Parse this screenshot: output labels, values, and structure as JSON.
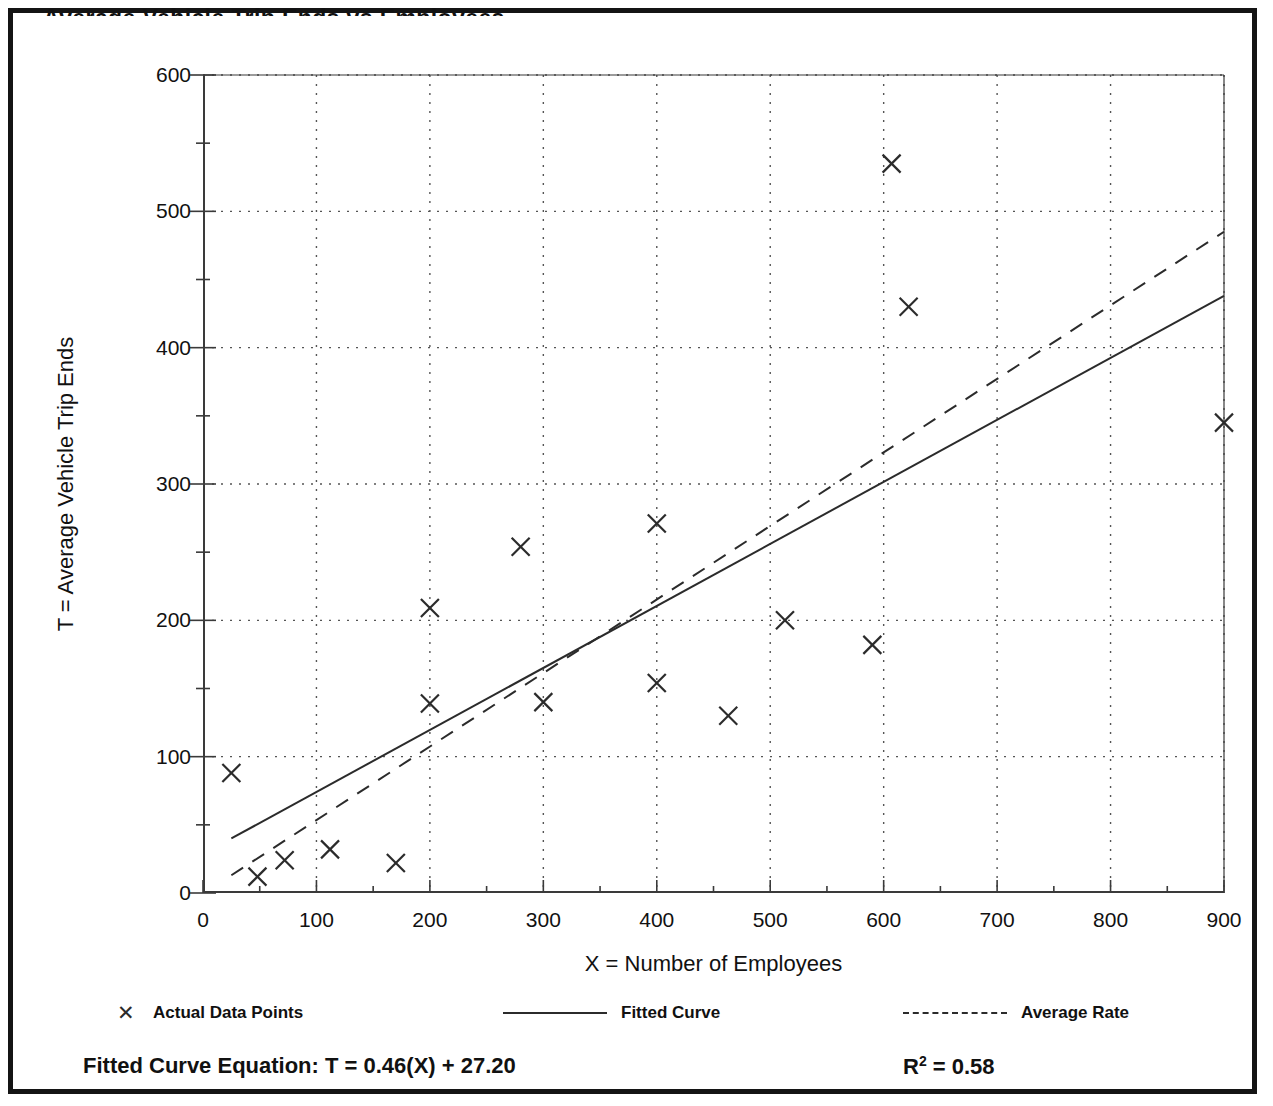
{
  "figure": {
    "clipped_title": "Average Vehicle Trip Ends vs Employees"
  },
  "chart_data": {
    "type": "scatter",
    "title": "",
    "xlabel": "X = Number of Employees",
    "ylabel": "T = Average Vehicle Trip Ends",
    "xlim": [
      0,
      900
    ],
    "ylim": [
      0,
      600
    ],
    "xticks": [
      0,
      100,
      200,
      300,
      400,
      500,
      600,
      700,
      800,
      900
    ],
    "yticks": [
      0,
      100,
      200,
      300,
      400,
      500,
      600
    ],
    "x_minor_tick_step": 50,
    "y_minor_tick_step": 50,
    "grid": true,
    "grid_style": "dotted",
    "legend_position": "below-axis",
    "series": [
      {
        "name": "Actual Data Points",
        "type": "scatter",
        "marker": "x",
        "points": [
          {
            "x": 25,
            "y": 88
          },
          {
            "x": 48,
            "y": 12
          },
          {
            "x": 72,
            "y": 24
          },
          {
            "x": 112,
            "y": 32
          },
          {
            "x": 170,
            "y": 22
          },
          {
            "x": 200,
            "y": 209
          },
          {
            "x": 200,
            "y": 139
          },
          {
            "x": 280,
            "y": 254
          },
          {
            "x": 300,
            "y": 140
          },
          {
            "x": 400,
            "y": 271
          },
          {
            "x": 400,
            "y": 154
          },
          {
            "x": 463,
            "y": 130
          },
          {
            "x": 513,
            "y": 200
          },
          {
            "x": 590,
            "y": 182
          },
          {
            "x": 607,
            "y": 535
          },
          {
            "x": 622,
            "y": 430
          },
          {
            "x": 900,
            "y": 345
          }
        ]
      },
      {
        "name": "Fitted Curve",
        "type": "line",
        "style": "solid",
        "endpoints": [
          {
            "x": 25,
            "y": 40
          },
          {
            "x": 900,
            "y": 438
          }
        ],
        "equation": "T = 0.46(X) + 27.20",
        "slope": 0.46,
        "intercept": 27.2,
        "r_squared": 0.58
      },
      {
        "name": "Average Rate",
        "type": "line",
        "style": "dashed",
        "endpoints": [
          {
            "x": 25,
            "y": 13
          },
          {
            "x": 900,
            "y": 485
          }
        ]
      }
    ]
  },
  "legend": {
    "items": [
      {
        "label": "Actual Data Points",
        "swatch": "x-marker-icon"
      },
      {
        "label": "Fitted Curve",
        "swatch": "solid-line-icon"
      },
      {
        "label": "Average Rate",
        "swatch": "dashed-line-icon"
      }
    ]
  },
  "footer": {
    "equation_label": "Fitted Curve Equation:  T = 0.46(X) + 27.20",
    "r_squared_prefix": "R",
    "r_squared_exponent": "2",
    "r_squared_value": " = 0.58"
  },
  "colors": {
    "frame": "#141414",
    "axis": "#3a3a3a",
    "grid": "#555555",
    "marker": "#2b2b2b",
    "fitted_line": "#2b2b2b",
    "average_line": "#2b2b2b",
    "text": "#111111"
  }
}
